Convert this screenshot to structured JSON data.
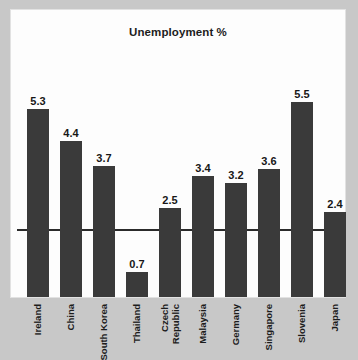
{
  "chart_data": {
    "type": "bar",
    "title": "Unemployment %",
    "xlabel": "",
    "ylabel": "",
    "ylim": [
      0,
      5.9
    ],
    "grid": false,
    "legend": false,
    "orientation": "vertical",
    "bar_color": "#3a3a3a",
    "background_color": "#c8c8c8",
    "card_color": "#fdfdfd",
    "axis_color": "#2b2b2b",
    "value_label_color": "#171717",
    "categories": [
      "Ireland",
      "China",
      "South Korea",
      "Thailand",
      "Czech Republic",
      "Malaysia",
      "Germany",
      "Singapore",
      "Slovenia",
      "Japan"
    ],
    "values": [
      5.3,
      4.4,
      3.7,
      0.7,
      2.5,
      3.4,
      3.2,
      3.6,
      5.5,
      2.4
    ],
    "bars": [
      {
        "category": "Ireland",
        "label_lines": [
          "Ireland"
        ],
        "value": 5.3,
        "value_label": "5.3"
      },
      {
        "category": "China",
        "label_lines": [
          "China"
        ],
        "value": 4.4,
        "value_label": "4.4"
      },
      {
        "category": "South Korea",
        "label_lines": [
          "South Korea"
        ],
        "value": 3.7,
        "value_label": "3.7"
      },
      {
        "category": "Thailand",
        "label_lines": [
          "Thailand"
        ],
        "value": 0.7,
        "value_label": "0.7"
      },
      {
        "category": "Czech Republic",
        "label_lines": [
          "Czech",
          "Republic"
        ],
        "value": 2.5,
        "value_label": "2.5"
      },
      {
        "category": "Malaysia",
        "label_lines": [
          "Malaysia"
        ],
        "value": 3.4,
        "value_label": "3.4"
      },
      {
        "category": "Germany",
        "label_lines": [
          "Germany"
        ],
        "value": 3.2,
        "value_label": "3.2"
      },
      {
        "category": "Singapore",
        "label_lines": [
          "Singapore"
        ],
        "value": 3.6,
        "value_label": "3.6"
      },
      {
        "category": "Slovenia",
        "label_lines": [
          "Slovenia"
        ],
        "value": 5.5,
        "value_label": "5.5"
      },
      {
        "category": "Japan",
        "label_lines": [
          "Japan"
        ],
        "value": 2.4,
        "value_label": "2.4"
      }
    ]
  }
}
